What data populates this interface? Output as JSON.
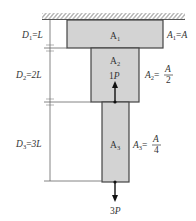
{
  "diagram": {
    "type": "stepped-bar-axial-load",
    "support": "fixed-ceiling",
    "colors": {
      "segment_fill": "#d3d3d3",
      "outline": "#444444",
      "line": "#555555",
      "arrow": "#111111"
    },
    "segments": [
      {
        "id": "1",
        "inner_label": "A",
        "inner_sub": "1",
        "area_label": "A",
        "area_sub": "1",
        "area_value": "A",
        "length_label": "D",
        "length_sub": "1",
        "length_value": "L"
      },
      {
        "id": "2",
        "inner_label": "A",
        "inner_sub": "2",
        "area_label": "A",
        "area_sub": "2",
        "area_num": "A",
        "area_den": "2",
        "length_label": "D",
        "length_sub": "2",
        "length_value": "2L"
      },
      {
        "id": "3",
        "inner_label": "A",
        "inner_sub": "3",
        "area_label": "A",
        "area_sub": "3",
        "area_num": "A",
        "area_den": "4",
        "length_label": "D",
        "length_sub": "3",
        "length_value": "3L"
      }
    ],
    "loads": [
      {
        "label_coef": "1",
        "label_var": "P",
        "direction": "up",
        "location": "bottom of segment 2"
      },
      {
        "label_coef": "3",
        "label_var": "P",
        "direction": "down",
        "location": "bottom of segment 3"
      }
    ]
  }
}
